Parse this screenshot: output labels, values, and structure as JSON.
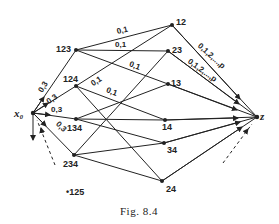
{
  "caption": "Fig. 8.4",
  "nodes": {
    "x0": {
      "label": "x₀",
      "x": 33,
      "y": 113
    },
    "n123": {
      "label": "123",
      "x": 76,
      "y": 50
    },
    "n124": {
      "label": "124",
      "x": 76,
      "y": 86
    },
    "n134": {
      "label": "134",
      "x": 76,
      "y": 119
    },
    "n234": {
      "label": "234",
      "x": 74,
      "y": 155
    },
    "n12": {
      "label": "12",
      "x": 172,
      "y": 25
    },
    "n23": {
      "label": "23",
      "x": 168,
      "y": 51
    },
    "n13": {
      "label": "13",
      "x": 168,
      "y": 84
    },
    "n14": {
      "label": "14",
      "x": 165,
      "y": 120
    },
    "n34": {
      "label": "34",
      "x": 164,
      "y": 143
    },
    "n24": {
      "label": "24",
      "x": 162,
      "y": 181
    },
    "z": {
      "label": "z",
      "x": 257,
      "y": 117
    },
    "n125": {
      "label": "•125",
      "x": 70,
      "y": 193
    }
  },
  "edge_labels": {
    "x0_123": "0,3",
    "x0_124": "0,3",
    "x0_134": "0,3",
    "x0_234": "0,3",
    "n123_12": "0,1",
    "n123_23": "0,1",
    "n123_13": "0,1",
    "n124_12": "0,1",
    "n124_14": "0,1",
    "n12_z": "0,1,2,...,p",
    "n23_z": "0,1,2,...,p"
  },
  "edges": [
    [
      "x0",
      "n123"
    ],
    [
      "x0",
      "n124"
    ],
    [
      "x0",
      "n134"
    ],
    [
      "x0",
      "n234"
    ],
    [
      "n123",
      "n12"
    ],
    [
      "n123",
      "n23"
    ],
    [
      "n123",
      "n13"
    ],
    [
      "n124",
      "n12"
    ],
    [
      "n124",
      "n14"
    ],
    [
      "n124",
      "n24"
    ],
    [
      "n134",
      "n13"
    ],
    [
      "n134",
      "n14"
    ],
    [
      "n134",
      "n34"
    ],
    [
      "n234",
      "n23"
    ],
    [
      "n234",
      "n34"
    ],
    [
      "n234",
      "n24"
    ],
    [
      "n12",
      "z"
    ],
    [
      "n23",
      "z"
    ],
    [
      "n13",
      "z"
    ],
    [
      "n14",
      "z"
    ],
    [
      "n34",
      "z"
    ],
    [
      "n24",
      "z"
    ]
  ]
}
